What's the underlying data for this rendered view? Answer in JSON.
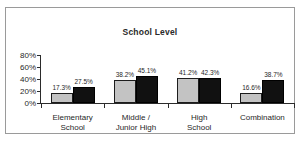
{
  "chart_data": {
    "type": "bar",
    "title": "School Level",
    "xlabel": "",
    "ylabel": "",
    "ylim": [
      0,
      80
    ],
    "grid": false,
    "legend": "none",
    "ytick_labels": [
      "80%",
      "60%",
      "40%",
      "20%",
      "0%"
    ],
    "ytick_values": [
      80,
      60,
      40,
      20,
      0
    ],
    "categories": [
      "Elementary\nSchool",
      "Middle /\nJunior High",
      "High\nSchool",
      "Combination"
    ],
    "category_lines": [
      [
        "Elementary",
        "School"
      ],
      [
        "Middle /",
        "Junior High"
      ],
      [
        "High",
        "School"
      ],
      [
        "Combination"
      ]
    ],
    "series": [
      {
        "name": "series-a",
        "color": "#c3c3c3",
        "values": [
          17.3,
          38.2,
          41.2,
          16.6
        ],
        "labels": [
          "17.3%",
          "38.2%",
          "41.2%",
          "16.6%"
        ]
      },
      {
        "name": "series-b",
        "color": "#111111",
        "values": [
          27.5,
          45.1,
          42.3,
          38.7
        ],
        "labels": [
          "27.5%",
          "45.1%",
          "42.3%",
          "38.7%"
        ]
      }
    ]
  }
}
